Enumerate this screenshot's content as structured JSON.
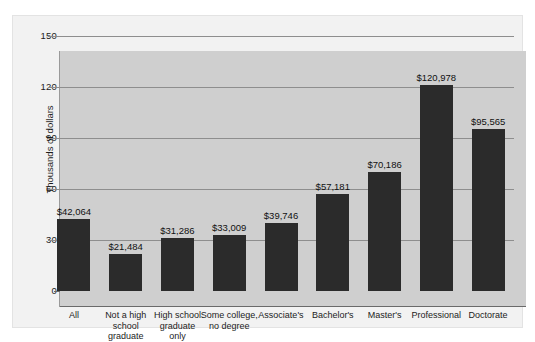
{
  "chart_data": {
    "type": "bar",
    "title": "",
    "xlabel": "",
    "ylabel": "Thousands of dollars",
    "ylim": [
      0,
      150
    ],
    "yticks": [
      0,
      30,
      60,
      90,
      120,
      150
    ],
    "ytick_labels": [
      "0",
      "30",
      "60",
      "90",
      "120",
      "150"
    ],
    "grid": true,
    "legend": "none",
    "categories": [
      "All",
      "Not a high school graduate",
      "High school graduate only",
      "Some college, no degree",
      "Associate's",
      "Bachelor's",
      "Master's",
      "Professional",
      "Doctorate"
    ],
    "category_lines": [
      [
        "All"
      ],
      [
        "Not a high",
        "school",
        "graduate"
      ],
      [
        "High school",
        "graduate",
        "only"
      ],
      [
        "Some college,",
        "no degree"
      ],
      [
        "Associate's"
      ],
      [
        "Bachelor's"
      ],
      [
        "Master's"
      ],
      [
        "Professional"
      ],
      [
        "Doctorate"
      ]
    ],
    "values": [
      42064,
      21484,
      31286,
      33009,
      39746,
      57181,
      70186,
      120978,
      95565
    ],
    "value_labels": [
      "$42,064",
      "$21,484",
      "$31,286",
      "$33,009",
      "$39,746",
      "$57,181",
      "$70,186",
      "$120,978",
      "$95,565"
    ],
    "value_units": "dollars",
    "bar_color": "#2b2b2b",
    "plot_background": "#cfcfcf",
    "figure_background": "#f2f2f2",
    "gridline_color": "#8e8e8e"
  }
}
